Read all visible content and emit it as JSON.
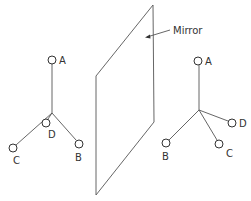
{
  "diagram": {
    "mirror": {
      "label": "Mirror"
    },
    "left_molecule": {
      "labels": {
        "A": "A",
        "B": "B",
        "C": "C",
        "D": "D"
      }
    },
    "right_molecule": {
      "labels": {
        "A": "A",
        "B": "B",
        "C": "C",
        "D": "D"
      }
    },
    "colors": {
      "line": "#555555",
      "text": "#333333",
      "background": "#ffffff"
    }
  }
}
